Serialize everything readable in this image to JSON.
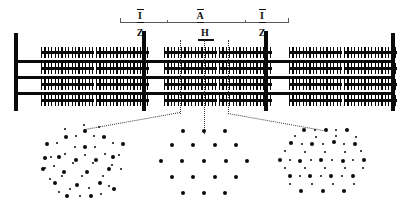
{
  "figure": {
    "ink_color": "#0a0a0a",
    "dotted_color": "#3a3a3a",
    "rule_color": "#5a5a5a",
    "background": "#ffffff"
  },
  "band_labels": [
    {
      "id": "band-i-left",
      "text": "I",
      "x": 140,
      "y": 9
    },
    {
      "id": "band-a",
      "text": "A",
      "x": 200,
      "y": 9
    },
    {
      "id": "band-i-right",
      "text": "I",
      "x": 262,
      "y": 9
    }
  ],
  "line_labels": [
    {
      "id": "z-left",
      "text": "Z",
      "x": 140,
      "y": 28
    },
    {
      "id": "h-zone",
      "text": "H",
      "x": 205,
      "y": 28
    },
    {
      "id": "z-right",
      "text": "Z",
      "x": 262,
      "y": 28
    }
  ],
  "rule": {
    "x": 120,
    "y": 22,
    "width": 168,
    "ticks": [
      120,
      167,
      245,
      288
    ]
  },
  "h_underline": {
    "x": 198,
    "y": 39,
    "width": 16
  },
  "myofibril": {
    "z_discs": [
      {
        "id": "z-disc-outer-left",
        "x": 14,
        "y": 33,
        "width": 4,
        "height": 78
      },
      {
        "id": "z-disc-left",
        "x": 142,
        "y": 31,
        "width": 4,
        "height": 80
      },
      {
        "id": "z-disc-right",
        "x": 264,
        "y": 31,
        "width": 4,
        "height": 80
      },
      {
        "id": "z-disc-outer-right",
        "x": 391,
        "y": 33,
        "width": 4,
        "height": 78
      }
    ],
    "actin_lines": [
      {
        "id": "actin-line-1",
        "x": 14,
        "y": 60,
        "width": 381,
        "height": 3
      },
      {
        "id": "actin-line-2",
        "x": 14,
        "y": 76,
        "width": 381,
        "height": 3
      },
      {
        "id": "actin-line-3",
        "x": 14,
        "y": 92,
        "width": 381,
        "height": 3
      }
    ],
    "myosin_rows": [
      {
        "id": "myosin-row-1",
        "y": 47
      },
      {
        "id": "myosin-row-2",
        "y": 63
      },
      {
        "id": "myosin-row-3",
        "y": 79
      },
      {
        "id": "myosin-row-4",
        "y": 95
      }
    ],
    "myosin_segments": [
      {
        "row": 0,
        "x": 41,
        "width": 53
      },
      {
        "row": 0,
        "x": 96,
        "width": 53
      },
      {
        "row": 0,
        "x": 164,
        "width": 53
      },
      {
        "row": 0,
        "x": 219,
        "width": 53
      },
      {
        "row": 0,
        "x": 289,
        "width": 53
      },
      {
        "row": 0,
        "x": 344,
        "width": 53
      },
      {
        "row": 1,
        "x": 41,
        "width": 53
      },
      {
        "row": 1,
        "x": 96,
        "width": 53
      },
      {
        "row": 1,
        "x": 164,
        "width": 53
      },
      {
        "row": 1,
        "x": 219,
        "width": 53
      },
      {
        "row": 1,
        "x": 289,
        "width": 53
      },
      {
        "row": 1,
        "x": 344,
        "width": 53
      },
      {
        "row": 2,
        "x": 41,
        "width": 53
      },
      {
        "row": 2,
        "x": 96,
        "width": 53
      },
      {
        "row": 2,
        "x": 164,
        "width": 53
      },
      {
        "row": 2,
        "x": 219,
        "width": 53
      },
      {
        "row": 2,
        "x": 289,
        "width": 53
      },
      {
        "row": 2,
        "x": 344,
        "width": 53
      },
      {
        "row": 3,
        "x": 41,
        "width": 53
      },
      {
        "row": 3,
        "x": 96,
        "width": 53
      },
      {
        "row": 3,
        "x": 164,
        "width": 53
      },
      {
        "row": 3,
        "x": 219,
        "width": 53
      },
      {
        "row": 3,
        "x": 289,
        "width": 53
      },
      {
        "row": 3,
        "x": 344,
        "width": 53
      }
    ]
  },
  "callouts": {
    "vertical_dotted": [
      {
        "id": "callout-line-left",
        "x": 180,
        "y_top": 40,
        "y_bottom": 114
      },
      {
        "id": "callout-line-middle",
        "x": 204,
        "y_top": 40,
        "y_bottom": 114
      },
      {
        "id": "callout-line-right",
        "x": 228,
        "y_top": 40,
        "y_bottom": 114
      }
    ],
    "elbows": [
      {
        "id": "elbow-left",
        "x1": 180,
        "y1": 113,
        "x2": 85,
        "y2": 130
      },
      {
        "id": "elbow-right",
        "x1": 228,
        "y1": 113,
        "x2": 323,
        "y2": 130
      }
    ],
    "middle_drop": {
      "id": "middle-drop",
      "x": 204,
      "y_top": 113,
      "y_bottom": 134
    }
  },
  "cross_sections": [
    {
      "id": "cross-section-overlap-left",
      "label": "overlap-zone-lattice",
      "cx": 85,
      "cy": 163,
      "thick_filament_count": 19,
      "thin_filament_count": 30,
      "thick_dots": [
        [
          0,
          -32
        ],
        [
          -19,
          -26
        ],
        [
          19,
          -26
        ],
        [
          -38,
          -19
        ],
        [
          0,
          -16
        ],
        [
          38,
          -19
        ],
        [
          -26,
          -6
        ],
        [
          -9,
          -3
        ],
        [
          11,
          -3
        ],
        [
          28,
          -6
        ],
        [
          -42,
          6
        ],
        [
          -21,
          9
        ],
        [
          2,
          9
        ],
        [
          24,
          6
        ],
        [
          -30,
          20
        ],
        [
          -8,
          22
        ],
        [
          15,
          20
        ],
        [
          -18,
          33
        ],
        [
          6,
          33
        ],
        [
          29,
          26
        ],
        [
          -40,
          -5
        ]
      ],
      "thin_dots": [
        [
          -9,
          -27
        ],
        [
          9,
          -27
        ],
        [
          -28,
          -20
        ],
        [
          -10,
          -16
        ],
        [
          10,
          -16
        ],
        [
          28,
          -20
        ],
        [
          -20,
          -9
        ],
        [
          0,
          -8
        ],
        [
          20,
          -9
        ],
        [
          -34,
          -6
        ],
        [
          34,
          -8
        ],
        [
          -31,
          3
        ],
        [
          -12,
          0
        ],
        [
          8,
          0
        ],
        [
          27,
          2
        ],
        [
          -23,
          13
        ],
        [
          -3,
          13
        ],
        [
          18,
          13
        ],
        [
          36,
          6
        ],
        [
          -35,
          16
        ],
        [
          -15,
          26
        ],
        [
          4,
          25
        ],
        [
          24,
          23
        ],
        [
          -26,
          29
        ],
        [
          -5,
          33
        ],
        [
          16,
          31
        ],
        [
          -40,
          5
        ],
        [
          -1,
          -38
        ],
        [
          -20,
          -34
        ],
        [
          14,
          -36
        ]
      ]
    },
    {
      "id": "cross-section-h-zone",
      "label": "h-zone-lattice",
      "cx": 204,
      "cy": 163,
      "thick_filament_count": 19,
      "thin_filament_count": 0,
      "thick_dots": [
        [
          -21,
          -32
        ],
        [
          0,
          -32
        ],
        [
          21,
          -32
        ],
        [
          -32,
          -18
        ],
        [
          -11,
          -18
        ],
        [
          11,
          -18
        ],
        [
          32,
          -18
        ],
        [
          -43,
          -2
        ],
        [
          -22,
          -2
        ],
        [
          0,
          -2
        ],
        [
          22,
          -2
        ],
        [
          43,
          -2
        ],
        [
          -32,
          14
        ],
        [
          -11,
          14
        ],
        [
          11,
          14
        ],
        [
          32,
          14
        ],
        [
          -21,
          30
        ],
        [
          0,
          30
        ],
        [
          21,
          30
        ]
      ],
      "thin_dots": []
    },
    {
      "id": "cross-section-overlap-right",
      "label": "overlap-zone-lattice",
      "cx": 323,
      "cy": 163,
      "thick_filament_count": 19,
      "thin_filament_count": 30,
      "thick_dots": [
        [
          -19,
          -33
        ],
        [
          3,
          -33
        ],
        [
          24,
          -33
        ],
        [
          -32,
          -20
        ],
        [
          -11,
          -19
        ],
        [
          11,
          -21
        ],
        [
          32,
          -19
        ],
        [
          -43,
          -3
        ],
        [
          -23,
          -2
        ],
        [
          -2,
          -3
        ],
        [
          20,
          -2
        ],
        [
          41,
          -3
        ],
        [
          -33,
          13
        ],
        [
          -13,
          13
        ],
        [
          8,
          13
        ],
        [
          30,
          13
        ],
        [
          -22,
          28
        ],
        [
          0,
          28
        ],
        [
          21,
          28
        ]
      ],
      "thin_dots": [
        [
          -8,
          -33
        ],
        [
          13,
          -33
        ],
        [
          -28,
          -27
        ],
        [
          -7,
          -26
        ],
        [
          13,
          -27
        ],
        [
          33,
          -26
        ],
        [
          -21,
          -19
        ],
        [
          0,
          -19
        ],
        [
          21,
          -19
        ],
        [
          -38,
          -12
        ],
        [
          -18,
          -11
        ],
        [
          2,
          -11
        ],
        [
          22,
          -11
        ],
        [
          38,
          -12
        ],
        [
          -33,
          -3
        ],
        [
          -12,
          -3
        ],
        [
          9,
          -3
        ],
        [
          30,
          -3
        ],
        [
          -38,
          5
        ],
        [
          -18,
          5
        ],
        [
          2,
          5
        ],
        [
          22,
          5
        ],
        [
          40,
          5
        ],
        [
          -23,
          13
        ],
        [
          -2,
          13
        ],
        [
          19,
          13
        ],
        [
          -33,
          21
        ],
        [
          -11,
          21
        ],
        [
          10,
          21
        ],
        [
          31,
          21
        ]
      ]
    }
  ]
}
